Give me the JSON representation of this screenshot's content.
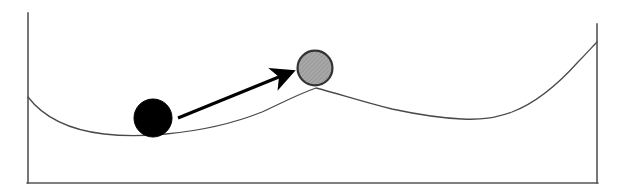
{
  "figure": {
    "type": "energy-landscape-diagram",
    "title": "",
    "caption": "",
    "width": 621,
    "height": 194,
    "background_color": "#ffffff"
  },
  "axes": {
    "left_axis": {
      "name": "left-vertical-axis",
      "x": 28,
      "y_top": 13,
      "y_bottom": 183,
      "color": "#555555",
      "stroke_width": 1.6
    },
    "right_axis": {
      "name": "right-vertical-axis",
      "x": 597,
      "y_top": 24,
      "y_bottom": 183,
      "color": "#555555",
      "stroke_width": 1.6
    },
    "bottom_axis": {
      "name": "bottom-horizontal-axis",
      "x_left": 28,
      "x_right": 597,
      "y": 183,
      "color": "#555555",
      "stroke_width": 1.6
    }
  },
  "curve": {
    "name": "potential-energy-curve",
    "color": "#4a4a4a",
    "stroke_width": 1.3,
    "path": "M 28 97 C 44 118, 70 130, 104 134 C 128 137, 146 136, 166 134 C 198 131, 232 124, 262 112 C 280 104, 296 95, 316 88 C 336 93, 360 101, 392 109 C 420 115, 440 118, 462 119 C 482 120, 494 118, 512 112 C 536 103, 560 82, 578 62 C 588 52, 593 46, 597 42",
    "features": [
      {
        "label": "left wall",
        "x": 28,
        "y": 97
      },
      {
        "label": "global minimum",
        "x": 150,
        "y": 135
      },
      {
        "label": "local maximum (barrier)",
        "x": 316,
        "y": 88
      },
      {
        "label": "secondary minimum",
        "x": 470,
        "y": 119
      },
      {
        "label": "right wall",
        "x": 597,
        "y": 42
      }
    ]
  },
  "balls": [
    {
      "name": "black-ball",
      "role": "initial-state",
      "cx": 153,
      "cy": 118,
      "rx": 19,
      "ry": 19,
      "fill": "#000000",
      "stroke": "#000000",
      "stroke_width": 1
    },
    {
      "name": "gray-ball",
      "role": "target-state",
      "cx": 315,
      "cy": 68,
      "rx": 18,
      "ry": 18,
      "fill": "#9e9e9e",
      "stroke": "#333333",
      "stroke_width": 2.2,
      "texture": "diagonal-hatch"
    }
  ],
  "arrow": {
    "name": "transition-arrow",
    "x1": 178,
    "y1": 118,
    "x2": 296,
    "y2": 70,
    "color": "#000000",
    "stroke_width": 3,
    "head_length": 22,
    "head_width": 17
  }
}
